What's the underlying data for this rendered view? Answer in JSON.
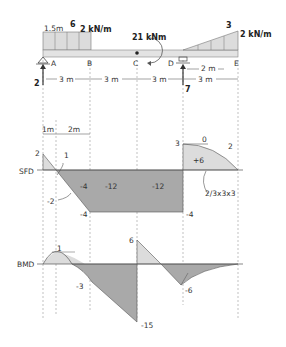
{
  "beam": {
    "points": [
      "A",
      "B",
      "C",
      "D",
      "E"
    ],
    "udl_label": "2 kN/m",
    "udl_length_label": "1.5m",
    "udl_resultant": "6",
    "moment_label": "21 kNm",
    "triangular_label": "2 kN/m",
    "triangular_resultant": "3",
    "triangular_length_label": "2 m",
    "reaction_A": "2",
    "reaction_D": "7",
    "spans": [
      "3 m",
      "3 m",
      "3 m",
      "3 m"
    ]
  },
  "sfd": {
    "title": "SFD",
    "dims": [
      "1m",
      "2m"
    ],
    "values": {
      "a_top": "2",
      "area_1": "1",
      "area_2": "-2",
      "b_end": "-4",
      "area_bc": "-4",
      "area_cd1": "-12",
      "area_cd2": "-12",
      "d_bottom": "-4",
      "d_top": "3",
      "slope_zero": "0",
      "area_de": "+6",
      "e_slope": "2",
      "parabola_note": "2/3x3x3"
    }
  },
  "bmd": {
    "title": "BMD",
    "values": {
      "max_pos": "1",
      "b_value": "-3",
      "c_top": "6",
      "c_bottom": "-15",
      "d_value": "-6"
    }
  },
  "colors": {
    "dark_fill": "#a9a9a9",
    "light_fill": "#dcdcdc",
    "line": "#555555"
  }
}
